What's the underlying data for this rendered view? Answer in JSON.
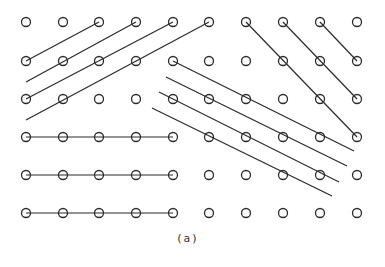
{
  "diagram": {
    "caption": "(a)",
    "stroke_color": "#2a2a2a",
    "background": "#ffffff",
    "circle_radius": 4.5,
    "grid": {
      "columns_x": [
        26,
        63,
        99,
        136,
        173,
        209,
        246,
        283,
        320,
        357
      ],
      "rows_y": [
        22,
        61,
        99,
        137,
        175,
        213
      ]
    },
    "lines": [
      {
        "group": "upper-left-rising",
        "from": [
          26,
          61
        ],
        "to": [
          99,
          22
        ]
      },
      {
        "group": "upper-left-rising",
        "from": [
          26,
          82
        ],
        "to": [
          136,
          22
        ]
      },
      {
        "group": "upper-left-rising",
        "from": [
          26,
          99
        ],
        "to": [
          173,
          22
        ]
      },
      {
        "group": "upper-left-rising",
        "from": [
          26,
          120
        ],
        "to": [
          209,
          22
        ]
      },
      {
        "group": "upper-right-falling",
        "from": [
          246,
          22
        ],
        "to": [
          357,
          137
        ]
      },
      {
        "group": "upper-right-falling",
        "from": [
          283,
          22
        ],
        "to": [
          357,
          99
        ]
      },
      {
        "group": "upper-right-falling",
        "from": [
          320,
          22
        ],
        "to": [
          357,
          61
        ]
      },
      {
        "group": "middle-falling",
        "from": [
          173,
          61
        ],
        "to": [
          354,
          151
        ]
      },
      {
        "group": "middle-falling",
        "from": [
          166,
          77
        ],
        "to": [
          347,
          166
        ]
      },
      {
        "group": "middle-falling",
        "from": [
          159,
          92
        ],
        "to": [
          339,
          182
        ]
      },
      {
        "group": "middle-falling",
        "from": [
          152,
          108
        ],
        "to": [
          332,
          196
        ]
      },
      {
        "group": "lower-left-horizontal",
        "from": [
          26,
          137
        ],
        "to": [
          173,
          137
        ]
      },
      {
        "group": "lower-left-horizontal",
        "from": [
          26,
          175
        ],
        "to": [
          173,
          175
        ]
      },
      {
        "group": "lower-left-horizontal",
        "from": [
          26,
          213
        ],
        "to": [
          173,
          213
        ]
      }
    ]
  }
}
